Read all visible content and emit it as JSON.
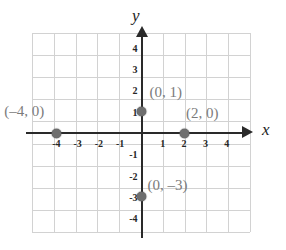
{
  "chart_data": {
    "type": "scatter",
    "title": "",
    "xlabel": "x",
    "ylabel": "y",
    "xlim": [
      -5.2,
      5.2
    ],
    "ylim": [
      -4.8,
      4.8
    ],
    "grid": true,
    "legend": null,
    "x_ticks": [
      "-4",
      "-3",
      "-2",
      "-1",
      "1",
      "2",
      "3",
      "4"
    ],
    "x_tick_values": [
      -4,
      -3,
      -2,
      -1,
      1,
      2,
      3,
      4
    ],
    "y_ticks": [
      "4",
      "3",
      "2",
      "1",
      "-1",
      "-2",
      "-3",
      "-4"
    ],
    "y_tick_values": [
      4,
      3,
      2,
      1,
      -1,
      -2,
      -3,
      -4
    ],
    "points": [
      {
        "x": -4,
        "y": 0,
        "label": "(–4, 0)"
      },
      {
        "x": 0,
        "y": 1,
        "label": "(0, 1)"
      },
      {
        "x": 2,
        "y": 0,
        "label": "(2, 0)"
      },
      {
        "x": 0,
        "y": -3,
        "label": "(0, –3)"
      }
    ],
    "colors": {
      "grid": "#d2d2d2",
      "axis": "#2a2a2a",
      "point": "#6e6e6e",
      "point_label": "#7b7b7b",
      "tick_label": "#262626",
      "background": "#ffffff"
    }
  },
  "axes": {
    "x_letter": "x",
    "y_letter": "y"
  },
  "ticks": {
    "x": [
      {
        "text": "-4"
      },
      {
        "text": "-3"
      },
      {
        "text": "-2"
      },
      {
        "text": "-1"
      },
      {
        "text": "1"
      },
      {
        "text": "2"
      },
      {
        "text": "3"
      },
      {
        "text": "4"
      }
    ],
    "y": [
      {
        "text": "4"
      },
      {
        "text": "3"
      },
      {
        "text": "2"
      },
      {
        "text": "1"
      },
      {
        "text": "-1"
      },
      {
        "text": "-2"
      },
      {
        "text": "-3"
      },
      {
        "text": "-4"
      }
    ]
  },
  "point_labels": {
    "left": "(–4, 0)",
    "upper": "(0, 1)",
    "right": "(2, 0)",
    "lower": "(0, –3)"
  }
}
